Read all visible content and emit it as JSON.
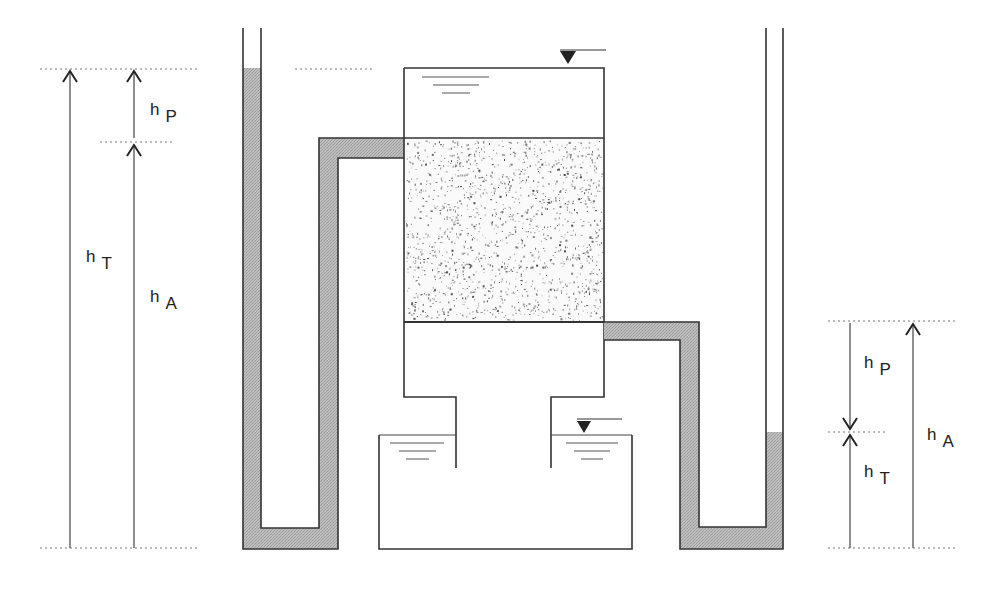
{
  "diagram": {
    "type": "permeameter-head-loss-schematic",
    "colors": {
      "background": "#ffffff",
      "line": "#333333",
      "water_fill": "#b5b5b5",
      "sand_dot": "#3a3a3a",
      "dotted_guide": "#777777"
    },
    "left_dimensions": {
      "outer_label": {
        "main": "h",
        "sub": "T"
      },
      "upper_label": {
        "main": "h",
        "sub": "P"
      },
      "lower_label": {
        "main": "h",
        "sub": "A"
      }
    },
    "right_dimensions": {
      "upper_label": {
        "main": "h",
        "sub": "P"
      },
      "lower_label": {
        "main": "h",
        "sub": "T"
      },
      "outer_label": {
        "main": "h",
        "sub": "A"
      }
    },
    "components": [
      {
        "name": "left-piezometer-tube",
        "water_level_y": 68
      },
      {
        "name": "filter-column",
        "water_surface_marker": "inverted-triangle"
      },
      {
        "name": "sand-bed"
      },
      {
        "name": "lower-chamber"
      },
      {
        "name": "outlet-basin",
        "water_surface_marker": "inverted-triangle"
      },
      {
        "name": "right-piezometer-tube",
        "water_level_y": 432
      }
    ]
  }
}
